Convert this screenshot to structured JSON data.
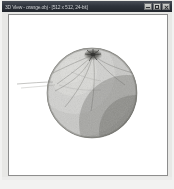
{
  "window": {
    "title": "3D View - orange.obj - [512 x 512, 24-bit]",
    "controls": {
      "minimize_label": "Minimize",
      "minimize_icon": "minimize-icon",
      "maximize_label": "Maximize",
      "maximize_icon": "maximize-icon",
      "close_label": "Close",
      "close_icon": "close-icon"
    },
    "colors": {
      "titlebar_dark": "#22262d",
      "titlebar_light": "#4a4f58",
      "titlebar_text": "#d8dadd",
      "canvas_background": "#ffffff",
      "canvas_border": "#8d8d8d",
      "window_chrome": "#e8e8e6",
      "page_background": "#f2f2f1"
    }
  },
  "viewport": {
    "name": "render-viewport",
    "background": "#ffffff",
    "width": 158,
    "height": 160
  },
  "render": {
    "object_name": "sphere-model",
    "description": "Shaded grayscale sphere with grainy surface texture and stem dimple",
    "geometry": {
      "center_x": 83,
      "center_y": 78,
      "radius": 45
    },
    "shading": {
      "light_direction": "upper-left",
      "highlight_color": "#d6d6d4",
      "midtone_color": "#b0b0ad",
      "shadow_color": "#8a8a87",
      "terminator_color": "#6f6f6c",
      "rim_color": "#7a7a77",
      "highlight_offset_x": -14,
      "highlight_offset_y": -16
    },
    "surface": {
      "texture": "fine-noise-grain",
      "noise_opacity": 0.3,
      "noise_scale": 0.9
    },
    "stem": {
      "name": "stem-dimple",
      "center_x": 84,
      "center_y": 39,
      "radius": 7,
      "color": "#4d4d4b",
      "ray_count": 7
    },
    "wireframe": {
      "name": "meridian-lines",
      "color": "#6d6d6a",
      "opacity": 0.55,
      "stroke_width": 0.55,
      "overhang_line": {
        "name": "overhang-strand",
        "from_x": 40,
        "from_y": 68,
        "to_x": 2,
        "to_y": 70
      }
    }
  }
}
